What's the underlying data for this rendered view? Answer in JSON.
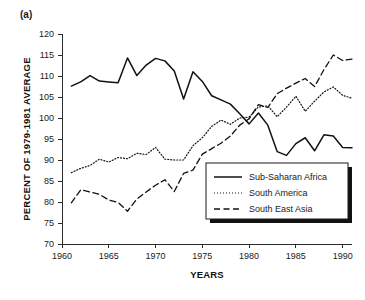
{
  "panel": {
    "label": "(a)"
  },
  "chart_data": {
    "type": "line",
    "title": "",
    "xlabel": "YEARS",
    "ylabel": "PERCENT OF 1979-1981 AVERAGE",
    "xlim": [
      1960,
      1991
    ],
    "ylim": [
      70,
      120
    ],
    "xticks": [
      1960,
      1965,
      1970,
      1975,
      1980,
      1985,
      1990
    ],
    "yticks": [
      70,
      75,
      80,
      85,
      90,
      95,
      100,
      105,
      110,
      115,
      120
    ],
    "xtick_labels": [
      "1960",
      "1965",
      "1970",
      "1975",
      "1980",
      "1985",
      "1990"
    ],
    "ytick_labels": [
      "70",
      "75",
      "80",
      "85",
      "90",
      "95",
      "100",
      "105",
      "110",
      "115",
      "120"
    ],
    "grid": false,
    "legend_position": "center-right",
    "x": [
      1961,
      1962,
      1963,
      1964,
      1965,
      1966,
      1967,
      1968,
      1969,
      1970,
      1971,
      1972,
      1973,
      1974,
      1975,
      1976,
      1977,
      1978,
      1979,
      1980,
      1981,
      1982,
      1983,
      1984,
      1985,
      1986,
      1987,
      1988,
      1989,
      1990,
      1991
    ],
    "series": [
      {
        "name": "Sub-Saharan Africa",
        "style": "solid",
        "color": "#111111",
        "values": [
          107.6,
          108.6,
          110.1,
          108.8,
          108.6,
          108.4,
          114.3,
          110.1,
          112.6,
          114.2,
          113.6,
          111.2,
          104.5,
          111.0,
          108.7,
          105.3,
          104.3,
          103.3,
          101.0,
          98.6,
          101.2,
          98.3,
          92.0,
          91.1,
          93.9,
          95.3,
          92.2,
          96.0,
          95.7,
          93.0,
          92.9
        ]
      },
      {
        "name": "South America",
        "style": "dotted",
        "color": "#111111",
        "values": [
          87.0,
          88.0,
          88.7,
          90.2,
          89.5,
          90.6,
          90.3,
          91.6,
          91.3,
          93.0,
          90.2,
          90.0,
          90.0,
          93.4,
          95.3,
          98.0,
          99.5,
          98.5,
          100.0,
          100.2,
          102.6,
          102.9,
          100.3,
          102.6,
          105.2,
          101.6,
          104.0,
          106.2,
          107.4,
          105.4,
          104.7
        ]
      },
      {
        "name": "South East Asia",
        "style": "dashed",
        "color": "#111111",
        "values": [
          79.8,
          82.9,
          82.4,
          81.8,
          80.5,
          79.9,
          77.8,
          80.7,
          82.4,
          84.0,
          85.3,
          82.5,
          86.8,
          87.6,
          91.4,
          92.7,
          94.0,
          95.7,
          98.3,
          99.8,
          103.2,
          102.5,
          105.8,
          107.1,
          108.3,
          109.4,
          107.5,
          111.5,
          115.0,
          113.7,
          114.0
        ]
      }
    ]
  },
  "legend": {
    "items": [
      {
        "label": "Sub-Saharan Africa",
        "style": "solid"
      },
      {
        "label": "South America",
        "style": "dotted"
      },
      {
        "label": "South East Asia",
        "style": "dashed"
      }
    ]
  }
}
